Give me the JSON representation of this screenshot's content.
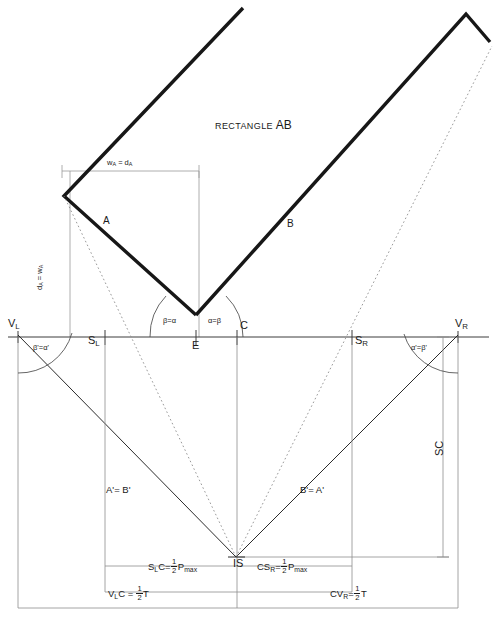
{
  "title": {
    "prefix": "RECTANGLE",
    "main": "AB"
  },
  "labels": {
    "segment_a": "A",
    "segment_b": "B",
    "width_a": {
      "w": "w",
      "wsub": "A",
      "eq": "=",
      "d": "d",
      "dsub": "A"
    },
    "depth_a": {
      "d": "d",
      "dsub": "A",
      "eq": "=",
      "w": "w",
      "wsub": "A"
    },
    "vertex_left": {
      "v": "V",
      "sub": "L"
    },
    "vertex_right": {
      "v": "V",
      "sub": "R"
    },
    "point_e": "E",
    "point_c": "C",
    "point_is": "IS",
    "station_left": {
      "s": "S",
      "sub": "L"
    },
    "station_right": {
      "s": "S",
      "sub": "R"
    },
    "sc": "SC",
    "angle_e_left": "β=α",
    "angle_e_right": "α=β",
    "angle_vl": "β'=α'",
    "angle_vr": "α'=β'",
    "chord_left": "A'= B'",
    "chord_right": "B'= A'",
    "eq_slc": {
      "lead": "S",
      "lead_sub": "L",
      "tail": "C",
      "eq": "=",
      "num": "1",
      "den": "2",
      "var": "P",
      "var_sub": "max"
    },
    "eq_csr": {
      "lead": "CS",
      "lead_sub": "R",
      "tail": "",
      "eq": "=",
      "num": "1",
      "den": "2",
      "var": "P",
      "var_sub": "max"
    },
    "eq_vlc": {
      "lead": "V",
      "lead_sub": "L",
      "tail": "C",
      "eq": "=",
      "num": "1",
      "den": "2",
      "var": "T",
      "var_sub": ""
    },
    "eq_cvr": {
      "lead": "CV",
      "lead_sub": "R",
      "tail": "",
      "eq": "=",
      "num": "1",
      "den": "2",
      "var": "T",
      "var_sub": ""
    }
  },
  "colors": {
    "ink": "#1a1a1a",
    "thick_line": "#171717",
    "thin_line": "#5b5b5b",
    "construction": "#9a9a9a",
    "background": "#ffffff"
  },
  "geometry": {
    "canvas": {
      "width": 497,
      "height": 620
    },
    "points": {
      "VL": [
        18,
        335
      ],
      "VR": [
        458,
        335
      ],
      "SL": [
        105,
        337
      ],
      "SR": [
        352,
        337
      ],
      "E": [
        196,
        337
      ],
      "C": [
        237,
        337
      ],
      "IS": [
        236,
        557
      ],
      "apex_A": [
        64,
        196
      ],
      "tip_A_top": [
        243,
        8
      ],
      "tip_B_top": [
        490,
        42
      ],
      "corner_B_top": [
        466,
        14
      ],
      "tangent_B_low": [
        196,
        315
      ]
    },
    "baseline_y": 337,
    "dim_rows": {
      "slc": 566,
      "vlc": 592,
      "outer": 608
    },
    "rect_top_y": 171,
    "rect_right_x": 199
  }
}
